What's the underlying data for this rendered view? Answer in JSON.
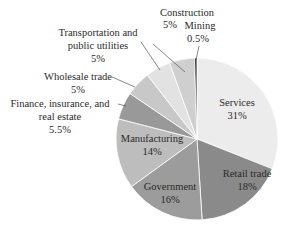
{
  "chart_data": {
    "type": "pie",
    "title": "",
    "start_angle_deg": 0,
    "direction": "clockwise",
    "slices": [
      {
        "label": "Services",
        "value": 31,
        "display": "31%",
        "color": "#ececec"
      },
      {
        "label": "Retail trade",
        "value": 18,
        "display": "18%",
        "color": "#8a8a8a"
      },
      {
        "label": "Government",
        "value": 16,
        "display": "16%",
        "color": "#9c9c9c"
      },
      {
        "label": "Manufacturing",
        "value": 14,
        "display": "14%",
        "color": "#bdbdbd"
      },
      {
        "label": "Finance, insurance, and real estate",
        "value": 5.5,
        "display": "5.5%",
        "color": "#999999"
      },
      {
        "label": "Wholesale trade",
        "value": 5,
        "display": "5%",
        "color": "#c8c8c8"
      },
      {
        "label": "Transportation and public utilities",
        "value": 5,
        "display": "5%",
        "color": "#e2e2e2"
      },
      {
        "label": "Construction",
        "value": 5,
        "display": "5%",
        "color": "#cfcfcf"
      },
      {
        "label": "Mining",
        "value": 0.5,
        "display": "0.5%",
        "color": "#3a3a3a"
      }
    ]
  },
  "labels": {
    "services": {
      "name": "Services",
      "pct": "31%"
    },
    "retail": {
      "name": "Retail trade",
      "pct": "18%"
    },
    "government": {
      "name": "Government",
      "pct": "16%"
    },
    "manufacturing": {
      "name": "Manufacturing",
      "pct": "14%"
    },
    "finance": {
      "line1": "Finance, insurance, and",
      "line2": "real estate",
      "pct": "5.5%"
    },
    "wholesale": {
      "name": "Wholesale trade",
      "pct": "5%"
    },
    "transportation": {
      "line1": "Transportation and",
      "line2": "public utilities",
      "pct": "5%"
    },
    "construction": {
      "name": "Construction",
      "pct": "5%"
    },
    "mining": {
      "name": "Mining",
      "pct": "0.5%"
    }
  }
}
